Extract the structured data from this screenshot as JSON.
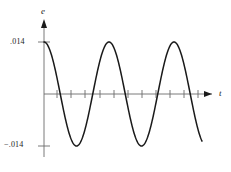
{
  "figure": {
    "name": "sinusoidal-emf-plot",
    "background_color": "#ffffff",
    "curve_color": "#1a1a1a",
    "axis_color": "#6b6b6b"
  },
  "axes": {
    "y_axis": {
      "label": "e",
      "label_icon": "y-axis-arrow-icon",
      "ticks": [
        {
          "label": ".014",
          "value": 0.014
        },
        {
          "label": "−.014",
          "value": -0.014
        }
      ]
    },
    "x_axis": {
      "label": "t",
      "label_icon": "x-axis-arrow-icon",
      "tick_count": 12,
      "tick_labels": []
    }
  },
  "chart_data": {
    "type": "line",
    "title": "",
    "xlabel": "t",
    "ylabel": "e",
    "grid": false,
    "legend": null,
    "amplitude": 0.014,
    "period": 65,
    "phase": "cosine",
    "ylim": [
      -0.0175,
      0.0175
    ],
    "xlim": [
      0,
      2.75
    ],
    "yticks": [
      -0.014,
      0.014
    ],
    "ytick_labels": [
      "−.014",
      ".014"
    ],
    "x": [
      0,
      0.125,
      0.25,
      0.375,
      0.5,
      0.625,
      0.75,
      0.875,
      1,
      1.125,
      1.25,
      1.375,
      1.5,
      1.625,
      1.75,
      1.875,
      2,
      2.125,
      2.25,
      2.375,
      2.5
    ],
    "values": [
      0.014,
      0.0099,
      0,
      -0.0099,
      -0.014,
      -0.0099,
      0,
      0.0099,
      0.014,
      0.0099,
      0,
      -0.0099,
      -0.014,
      -0.0099,
      0,
      0.0099,
      0.014,
      0.0099,
      0,
      -0.0099,
      -0.014
    ],
    "series": [
      {
        "name": "e(t)",
        "values": [
          0.014,
          0.0099,
          0,
          -0.0099,
          -0.014,
          -0.0099,
          0,
          0.0099,
          0.014,
          0.0099,
          0,
          -0.0099,
          -0.014,
          -0.0099,
          0,
          0.0099,
          0.014,
          0.0099,
          0,
          -0.0099,
          -0.014
        ]
      }
    ]
  }
}
